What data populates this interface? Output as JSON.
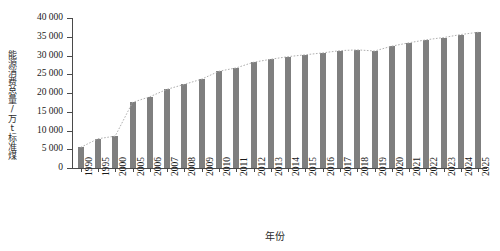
{
  "chart_data": {
    "type": "bar",
    "title": "",
    "xlabel": "年份",
    "ylabel": "能源消费总量/万t标准煤",
    "ylim": [
      0,
      40000
    ],
    "ytick_step": 5000,
    "grid": false,
    "legend": "none",
    "bar_color": "#7f7f7f",
    "trend_line": {
      "style": "dotted",
      "color": "#b0b0b0",
      "description": "dotted trend curve following bar tops"
    },
    "categories": [
      "1990",
      "1995",
      "2000",
      "2005",
      "2006",
      "2007",
      "2008",
      "2009",
      "2010",
      "2011",
      "2012",
      "2013",
      "2014",
      "2015",
      "2016",
      "2017",
      "2018",
      "2019",
      "2020",
      "2021",
      "2022",
      "2023",
      "2024",
      "2025"
    ],
    "values": [
      5500,
      7800,
      8500,
      17500,
      19000,
      21000,
      22300,
      23700,
      25800,
      26700,
      28200,
      29000,
      29700,
      30200,
      30700,
      31300,
      31500,
      31200,
      32500,
      33400,
      34200,
      34800,
      35600,
      36200
    ],
    "ytick_labels": [
      "0",
      "5 000",
      "10 000",
      "15 000",
      "20 000",
      "25 000",
      "30 000",
      "35 000",
      "40 000"
    ],
    "ytick_values": [
      0,
      5000,
      10000,
      15000,
      20000,
      25000,
      30000,
      35000,
      40000
    ]
  }
}
